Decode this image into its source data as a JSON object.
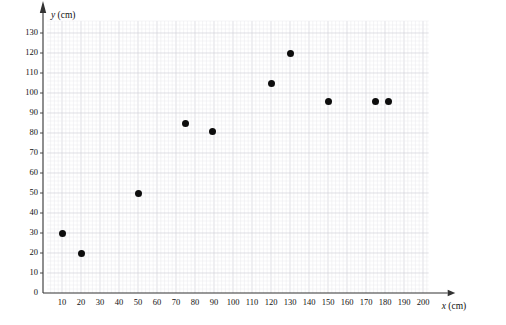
{
  "chart_data": {
    "type": "scatter",
    "title": "",
    "xlabel": "x (cm)",
    "ylabel": "y (cm)",
    "xlim": [
      0,
      205
    ],
    "ylim": [
      0,
      137
    ],
    "grid": true,
    "legend": "none",
    "x_ticks": [
      10,
      20,
      30,
      40,
      50,
      60,
      70,
      80,
      90,
      100,
      110,
      120,
      130,
      140,
      150,
      160,
      170,
      180,
      190,
      200
    ],
    "y_ticks": [
      0,
      10,
      20,
      30,
      40,
      50,
      60,
      70,
      80,
      90,
      100,
      110,
      120,
      130
    ],
    "points": [
      {
        "x": 10,
        "y": 30
      },
      {
        "x": 20,
        "y": 20
      },
      {
        "x": 50,
        "y": 50
      },
      {
        "x": 75,
        "y": 85
      },
      {
        "x": 89,
        "y": 81
      },
      {
        "x": 120,
        "y": 105
      },
      {
        "x": 130,
        "y": 120
      },
      {
        "x": 150,
        "y": 96
      },
      {
        "x": 175,
        "y": 96
      },
      {
        "x": 182,
        "y": 96
      }
    ],
    "colors": {
      "point": "#0d0d0d",
      "axis": "#333333",
      "grid_minor": "#e8e8ec",
      "grid_major": "#d2d2da",
      "background": "#ffffff"
    }
  },
  "axes": {
    "x_label_text": "x",
    "x_label_unit": "(cm)",
    "y_label_text": "y",
    "y_label_unit": "(cm)"
  }
}
